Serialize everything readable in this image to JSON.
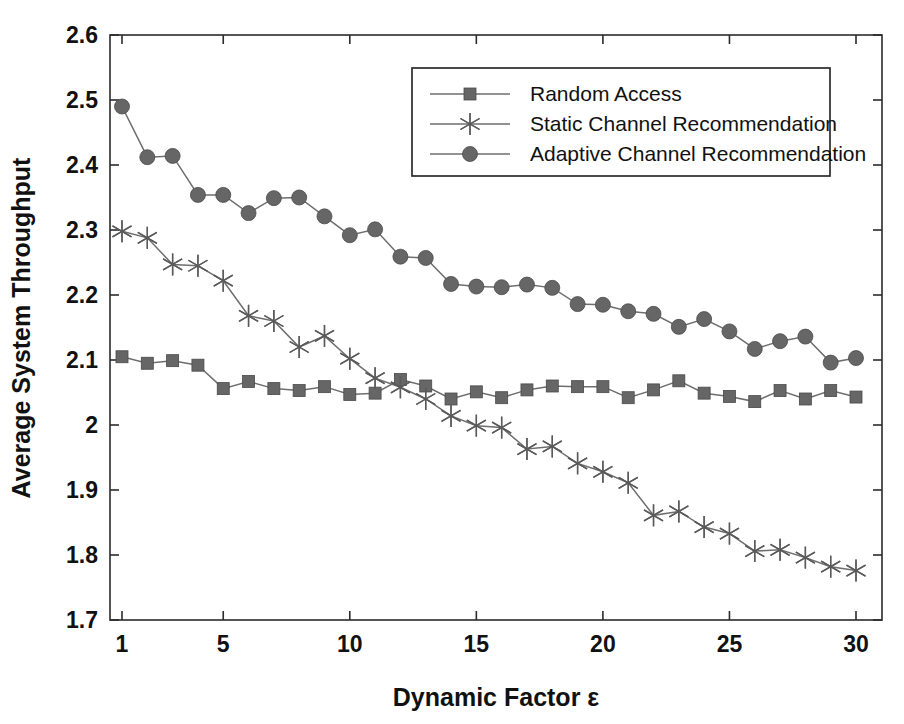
{
  "chart_data": {
    "type": "line",
    "title": "",
    "xlabel": "Dynamic Factor ε",
    "ylabel": "Average System Throughput",
    "xlim": [
      1,
      30
    ],
    "ylim": [
      1.7,
      2.6
    ],
    "xticks": [
      1,
      5,
      10,
      15,
      20,
      25,
      30
    ],
    "xtick_labels": [
      "1",
      "5",
      "10",
      "15",
      "20",
      "25",
      "30"
    ],
    "yticks": [
      1.7,
      1.8,
      1.9,
      2.0,
      2.1,
      2.2,
      2.3,
      2.4,
      2.5,
      2.6
    ],
    "ytick_labels": [
      "1.7",
      "1.8",
      "1.9",
      "2",
      "2.1",
      "2.2",
      "2.3",
      "2.4",
      "2.5",
      "2.6"
    ],
    "grid": false,
    "legend_position": "top-right",
    "x": [
      1,
      2,
      3,
      4,
      5,
      6,
      7,
      8,
      9,
      10,
      11,
      12,
      13,
      14,
      15,
      16,
      17,
      18,
      19,
      20,
      21,
      22,
      23,
      24,
      25,
      26,
      27,
      28,
      29,
      30
    ],
    "series": [
      {
        "name": "Random Access",
        "marker": "square",
        "color": "#666666",
        "values": [
          2.105,
          2.095,
          2.099,
          2.092,
          2.056,
          2.067,
          2.056,
          2.053,
          2.059,
          2.047,
          2.049,
          2.07,
          2.06,
          2.04,
          2.051,
          2.042,
          2.054,
          2.06,
          2.059,
          2.059,
          2.042,
          2.054,
          2.068,
          2.049,
          2.044,
          2.036,
          2.053,
          2.04,
          2.053,
          2.043
        ]
      },
      {
        "name": "Static Channel Recommendation",
        "marker": "star",
        "color": "#666666",
        "values": [
          2.298,
          2.288,
          2.247,
          2.245,
          2.222,
          2.168,
          2.16,
          2.12,
          2.137,
          2.102,
          2.072,
          2.058,
          2.04,
          2.014,
          1.999,
          1.996,
          1.963,
          1.967,
          1.941,
          1.928,
          1.911,
          1.861,
          1.867,
          1.843,
          1.833,
          1.806,
          1.808,
          1.796,
          1.782,
          1.776
        ]
      },
      {
        "name": "Adaptive Channel Recommendation",
        "marker": "circle",
        "color": "#666666",
        "values": [
          2.49,
          2.412,
          2.414,
          2.354,
          2.354,
          2.326,
          2.349,
          2.35,
          2.321,
          2.292,
          2.301,
          2.259,
          2.257,
          2.217,
          2.213,
          2.212,
          2.216,
          2.211,
          2.186,
          2.185,
          2.175,
          2.171,
          2.151,
          2.163,
          2.144,
          2.117,
          2.129,
          2.136,
          2.096,
          2.103
        ]
      }
    ]
  },
  "legend": {
    "entries": [
      {
        "label": "Random Access"
      },
      {
        "label": "Static Channel Recommendation"
      },
      {
        "label": "Adaptive Channel Recommendation"
      }
    ]
  },
  "axes": {
    "x_title": "Dynamic Factor ε",
    "y_title": "Average System Throughput"
  }
}
